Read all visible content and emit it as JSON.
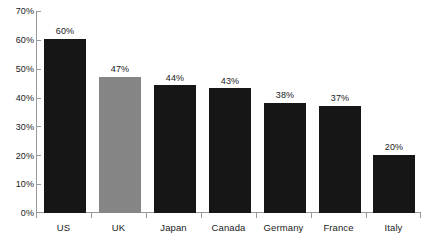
{
  "chart_data": {
    "type": "bar",
    "title": "",
    "subtitle": "",
    "xlabel": "",
    "ylabel": "",
    "ylim": [
      0,
      70
    ],
    "ytick_labels": [
      "0%",
      "10%",
      "20%",
      "30%",
      "40%",
      "50%",
      "60%",
      "70%"
    ],
    "ytick_values": [
      0,
      10,
      20,
      30,
      40,
      50,
      60,
      70
    ],
    "grid": false,
    "legend": null,
    "categories": [
      "US",
      "UK",
      "Japan",
      "Canada",
      "Germany",
      "France",
      "Italy"
    ],
    "values": [
      60,
      47,
      44,
      43,
      38,
      37,
      20
    ],
    "value_labels": [
      "60%",
      "47%",
      "44%",
      "43%",
      "38%",
      "37%",
      "20%"
    ],
    "highlight_category": "UK",
    "colors": {
      "bar_default": "#161616",
      "bar_highlight": "#858585",
      "axis": "#9a9a9a",
      "text": "#1a1a1a",
      "background": "#ffffff"
    }
  }
}
